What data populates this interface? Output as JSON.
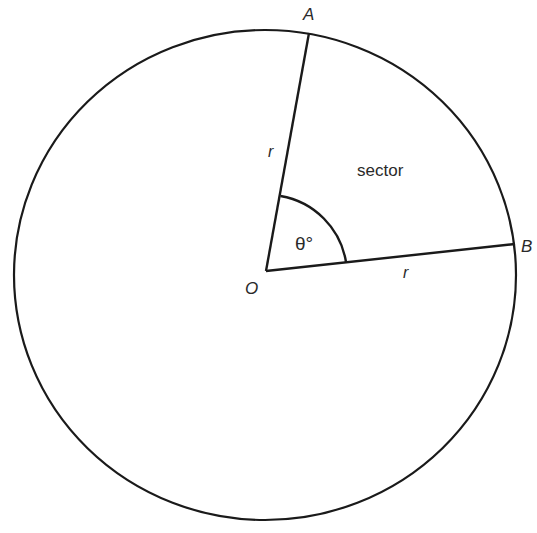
{
  "diagram": {
    "type": "circle-sector",
    "labels": {
      "point_a": "A",
      "point_b": "B",
      "center": "O",
      "radius_oa": "r",
      "radius_ob": "r",
      "angle": "θ°",
      "region": "sector"
    },
    "colors": {
      "stroke": "#1a1a1a",
      "text": "#2a2a2a",
      "background": "#ffffff"
    }
  }
}
